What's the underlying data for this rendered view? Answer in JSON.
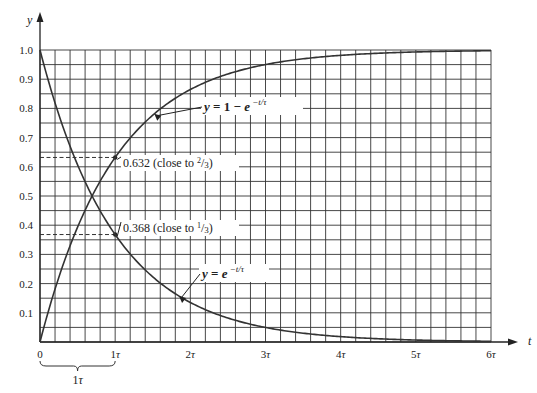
{
  "chart_data": {
    "type": "line",
    "title": "",
    "xlabel": "t",
    "ylabel": "y",
    "xlim": [
      0,
      6
    ],
    "ylim": [
      0,
      1.0
    ],
    "grid": true,
    "grid_divisions": {
      "x_per_tick": 5,
      "y_per_tick": 2
    },
    "x_ticks": [
      {
        "value": 0,
        "label": "0"
      },
      {
        "value": 1,
        "label": "1τ"
      },
      {
        "value": 2,
        "label": "2τ"
      },
      {
        "value": 3,
        "label": "3τ"
      },
      {
        "value": 4,
        "label": "4τ"
      },
      {
        "value": 5,
        "label": "5τ"
      },
      {
        "value": 6,
        "label": "6τ"
      }
    ],
    "y_ticks": [
      {
        "value": 0.1,
        "label": "0.1"
      },
      {
        "value": 0.2,
        "label": "0.2"
      },
      {
        "value": 0.3,
        "label": "0.3"
      },
      {
        "value": 0.4,
        "label": "0.4"
      },
      {
        "value": 0.5,
        "label": "0.5"
      },
      {
        "value": 0.6,
        "label": "0.6"
      },
      {
        "value": 0.7,
        "label": "0.7"
      },
      {
        "value": 0.8,
        "label": "0.8"
      },
      {
        "value": 0.9,
        "label": "0.9"
      },
      {
        "value": 1.0,
        "label": "1.0"
      }
    ],
    "series": [
      {
        "name": "y = 1 − e^(−t/τ)",
        "label_main": "y = 1 − e",
        "label_exp": "−t/τ",
        "x": [
          0,
          0.5,
          1,
          1.5,
          2,
          2.5,
          3,
          3.5,
          4,
          4.5,
          5,
          5.5,
          6
        ],
        "values": [
          0,
          0.393,
          0.632,
          0.777,
          0.865,
          0.918,
          0.95,
          0.97,
          0.982,
          0.989,
          0.993,
          0.996,
          0.998
        ]
      },
      {
        "name": "y = e^(−t/τ)",
        "label_main": "y = e",
        "label_exp": "−t/τ",
        "x": [
          0,
          0.5,
          1,
          1.5,
          2,
          2.5,
          3,
          3.5,
          4,
          4.5,
          5,
          5.5,
          6
        ],
        "values": [
          1.0,
          0.607,
          0.368,
          0.223,
          0.135,
          0.082,
          0.05,
          0.03,
          0.018,
          0.011,
          0.007,
          0.004,
          0.002
        ]
      }
    ],
    "annotations": [
      {
        "x": 1,
        "y": 0.632,
        "text": "0.632 (close to 2/3)",
        "text_main": "0.632 (close to ",
        "frac_num": "2",
        "frac_den": "3",
        "text_end": ")"
      },
      {
        "x": 1,
        "y": 0.368,
        "text": "0.368 (close to 1/3)",
        "text_main": "0.368 (close to ",
        "frac_num": "1",
        "frac_den": "3",
        "text_end": ")"
      }
    ],
    "brace": {
      "from": 0,
      "to": 1,
      "label": "1τ"
    }
  }
}
